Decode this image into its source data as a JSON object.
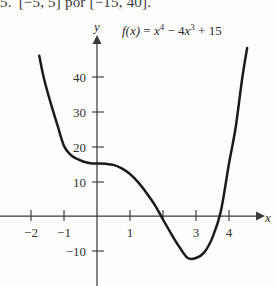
{
  "caption": {
    "number": "5.",
    "text": "[−5, 5] por [−15, 40]."
  },
  "formula": {
    "fname": "f(x)",
    "equals": "=",
    "term1_base": "x",
    "term1_exp": "4",
    "minus": "−",
    "term2_coef": "4",
    "term2_base": "x",
    "term2_exp": "3",
    "plus": "+",
    "term3": "15",
    "plain": "f(x) = x⁴ − 4x³ + 15"
  },
  "axes": {
    "x_label": "x",
    "y_label": "y"
  },
  "chart_data": {
    "type": "line",
    "title": "",
    "subtitle": "",
    "xlabel": "x",
    "ylabel": "y",
    "function": "f(x) = x^4 - 4x^3 + 15",
    "grid": false,
    "legend": "none",
    "xlim": [
      -2.9,
      5.0
    ],
    "ylim": [
      -16,
      48
    ],
    "x_ticks": [
      -2,
      -1,
      1,
      2,
      3,
      4
    ],
    "x_tick_labels": [
      "−2",
      "−1",
      "1",
      "",
      "3",
      "4"
    ],
    "y_ticks": [
      10,
      20,
      30,
      40,
      -10
    ],
    "y_tick_labels": [
      "10",
      "20",
      "30",
      "40",
      "−10"
    ],
    "series": [
      {
        "name": "f(x) = x⁴ − 4x³ + 15",
        "color": "#1a1a1a",
        "x": [
          -1.75,
          -1.6,
          -1.4,
          -1.2,
          -1.0,
          -0.8,
          -0.6,
          -0.4,
          -0.2,
          0.0,
          0.25,
          0.5,
          0.75,
          1.0,
          1.25,
          1.5,
          1.75,
          2.0,
          2.25,
          2.5,
          2.75,
          3.0,
          3.25,
          3.5,
          3.75,
          4.0,
          4.2,
          4.4,
          4.55
        ],
        "y": [
          45.8,
          39.0,
          32.2,
          26.0,
          20.0,
          17.5,
          16.3,
          15.5,
          15.1,
          15.0,
          14.9,
          14.6,
          13.6,
          12.0,
          9.6,
          6.6,
          3.2,
          -1.0,
          -5.1,
          -8.9,
          -12.0,
          -12.0,
          -10.4,
          -6.1,
          1.2,
          15.0,
          25.2,
          39.3,
          48.0
        ],
        "critical_points": [
          {
            "label": "y-intercept",
            "x": 0,
            "y": 15
          },
          {
            "label": "local minimum",
            "x": 3,
            "y": -12
          },
          {
            "label": "inflection/flat",
            "x": 0,
            "y": 15
          }
        ]
      }
    ]
  }
}
